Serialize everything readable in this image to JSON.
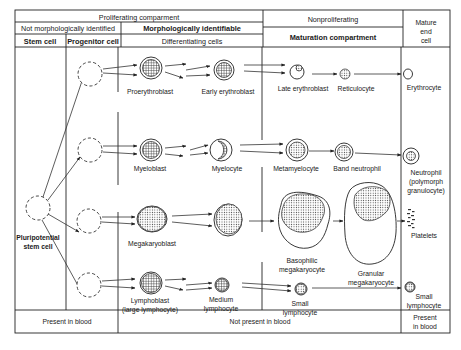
{
  "header": {
    "proliferating": "Proliferating comparment",
    "nonproliferating": "Nonproliferating",
    "mature_end_cell": [
      "Mature",
      "end",
      "cell"
    ],
    "not_morph_identified": "Not morphologically identified",
    "morph_identifiable": "Morphologically identifiable",
    "maturation_compartment": "Maturation compartment",
    "stem_cell": "Stem cell",
    "progenitor_cell": "Progenitor cell",
    "differentiating_cells": "Differentiating cells"
  },
  "stem": {
    "label_line1": "Pluripotential",
    "label_line2": "stem cell"
  },
  "lineages": {
    "erythroid": {
      "cells": [
        "Proerythroblast",
        "Early erythroblast",
        "Late erythroblast",
        "Reticulocyte",
        "Erythrocyte"
      ]
    },
    "granulocytic": {
      "cells": [
        "Myeloblast",
        "Myelocyte",
        "Metamyelocyte",
        "Band neutrophil"
      ],
      "mature_line1": "Neutrophil",
      "mature_line2": "(polymorph",
      "mature_line3": "granulocyte)"
    },
    "megakaryocytic": {
      "cells": [
        "Megakaryoblast",
        "Platelets"
      ],
      "basophilic_line1": "Basophilic",
      "basophilic_line2": "megakaryocyte",
      "granular_line1": "Granular",
      "granular_line2": "megakaryocyte"
    },
    "lymphoid": {
      "lymphoblast_line1": "Lymphoblast",
      "lymphoblast_line2": "(large lymphocyte)",
      "medium_line1": "Medium",
      "medium_line2": "lymphocyte",
      "small_line1": "Small",
      "small_line2": "lymphocyte",
      "mature_line1": "Small",
      "mature_line2": "lymphocyte"
    }
  },
  "footer": {
    "present_left": "Present in blood",
    "not_present": "Not present in blood",
    "present_right_line1": "Present",
    "present_right_line2": "in blood"
  }
}
